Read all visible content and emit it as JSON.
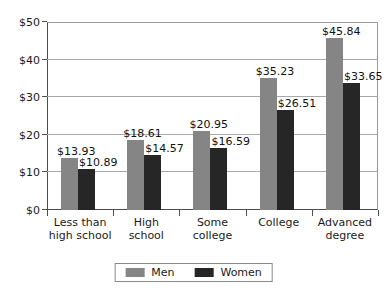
{
  "chart_data": {
    "type": "bar",
    "title": "",
    "subtitle": "",
    "xlabel": "",
    "ylabel": "",
    "ylim": [
      0,
      50
    ],
    "ytick_values": [
      0,
      10,
      20,
      30,
      40,
      50
    ],
    "ytick_labels": [
      "$0",
      "$10",
      "$20",
      "$30",
      "$40",
      "$50"
    ],
    "grid": true,
    "grid_axis": "y",
    "legend_position": "bottom-center",
    "value_prefix": "$",
    "categories": [
      "Less than high school",
      "High school",
      "Some college",
      "College",
      "Advanced degree"
    ],
    "category_lines": [
      [
        "Less than",
        "high school"
      ],
      [
        "High",
        "school"
      ],
      [
        "Some",
        "college"
      ],
      [
        "College",
        ""
      ],
      [
        "Advanced",
        "degree"
      ]
    ],
    "series": [
      {
        "name": "Men",
        "color": "#858585",
        "values": [
          13.93,
          18.61,
          20.95,
          35.23,
          45.84
        ],
        "labels": [
          "$13.93",
          "$18.61",
          "$20.95",
          "$35.23",
          "$45.84"
        ]
      },
      {
        "name": "Women",
        "color": "#262626",
        "values": [
          10.89,
          14.57,
          16.59,
          26.51,
          33.65
        ],
        "labels": [
          "$10.89",
          "$14.57",
          "$16.59",
          "$26.51",
          "$33.65"
        ]
      }
    ]
  },
  "legend": {
    "items": [
      {
        "label": "Men",
        "color": "#858585"
      },
      {
        "label": "Women",
        "color": "#262626"
      }
    ]
  }
}
